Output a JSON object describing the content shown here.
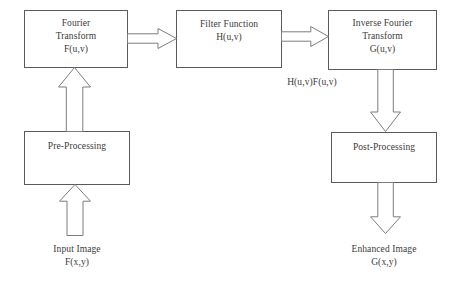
{
  "diagram": {
    "colors": {
      "box_border": "#5a5a5a",
      "arrow_stroke": "#7d7d7d",
      "arrow_fill": "#ffffff",
      "text": "#3a3a3a",
      "background": "#ffffff"
    },
    "boxes": [
      {
        "id": "fourier-transform",
        "name": "fourier-transform-box",
        "label": "Fourier\nTransform\nF(u,v)",
        "x": 24,
        "y": 10,
        "w": 104,
        "h": 58,
        "text_top": 6
      },
      {
        "id": "filter-function",
        "name": "filter-function-box",
        "label": "Filter Function\nH(u,v)",
        "x": 176,
        "y": 10,
        "w": 106,
        "h": 58,
        "text_top": 7
      },
      {
        "id": "inverse-fourier-transform",
        "name": "inverse-fourier-transform-box",
        "label": "Inverse Fourier\nTransform\nG(u,v)",
        "x": 328,
        "y": 10,
        "w": 109,
        "h": 60,
        "text_top": 6
      },
      {
        "id": "pre-processing",
        "name": "pre-processing-box",
        "label": "Pre-Processing",
        "x": 24,
        "y": 131,
        "w": 106,
        "h": 54,
        "text_top": 8
      },
      {
        "id": "post-processing",
        "name": "post-processing-box",
        "label": "Post-Processing",
        "x": 331,
        "y": 132,
        "w": 106,
        "h": 51,
        "text_top": 8
      }
    ],
    "captions": [
      {
        "id": "intermediate-signal",
        "name": "intermediate-signal-label",
        "label": "H(u,v)F(u,v)",
        "x": 262,
        "y": 76,
        "w": 100
      },
      {
        "id": "input-image",
        "name": "input-image-label",
        "label": "Input Image\nF(x,y)",
        "x": 24,
        "y": 243,
        "w": 106
      },
      {
        "id": "enhanced-image",
        "name": "enhanced-image-label",
        "label": "Enhanced Image\nG(x,y)",
        "x": 331,
        "y": 243,
        "w": 106
      }
    ],
    "arrows": [
      {
        "id": "input-to-preprocessing",
        "name": "arrow-input-to-preprocessing",
        "direction": "up",
        "from": "input-image",
        "to": "pre-processing",
        "x": 59,
        "y": 184,
        "w": 32,
        "h": 52
      },
      {
        "id": "preprocessing-to-fourier",
        "name": "arrow-preprocessing-to-fourier",
        "direction": "up",
        "from": "pre-processing",
        "to": "fourier-transform",
        "x": 58,
        "y": 67,
        "w": 33,
        "h": 65
      },
      {
        "id": "fourier-to-filter",
        "name": "arrow-fourier-to-filter",
        "direction": "right",
        "from": "fourier-transform",
        "to": "filter-function",
        "x": 127,
        "y": 28,
        "w": 50,
        "h": 21
      },
      {
        "id": "filter-to-inverse",
        "name": "arrow-filter-to-inverse",
        "direction": "right",
        "from": "filter-function",
        "to": "inverse-fourier-transform",
        "x": 281,
        "y": 26,
        "w": 48,
        "h": 21
      },
      {
        "id": "inverse-to-postprocessing",
        "name": "arrow-inverse-to-postprocessing",
        "direction": "down",
        "from": "inverse-fourier-transform",
        "to": "post-processing",
        "x": 370,
        "y": 69,
        "w": 31,
        "h": 63
      },
      {
        "id": "postprocessing-to-enhanced",
        "name": "arrow-postprocessing-to-enhanced",
        "direction": "down",
        "from": "post-processing",
        "to": "enhanced-image",
        "x": 370,
        "y": 182,
        "w": 31,
        "h": 52
      }
    ]
  }
}
